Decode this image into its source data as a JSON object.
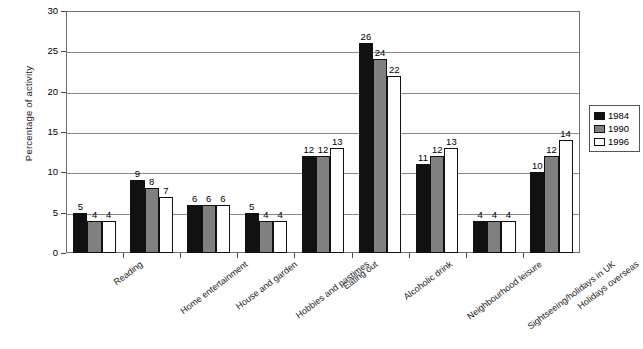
{
  "chart_data": {
    "type": "bar",
    "title": "",
    "xlabel": "",
    "ylabel": "Percentage of activity",
    "ylim": [
      0,
      30
    ],
    "ytick_step": 5,
    "yticks": [
      "0",
      "5",
      "10",
      "15",
      "20",
      "25",
      "30"
    ],
    "grid": true,
    "legend_position": "right",
    "categories": [
      "Reading",
      "Home entertainment",
      "House and garden",
      "Hobbies and pastimes",
      "Eating out",
      "Alcoholic drink",
      "Neighbourhood leisure",
      "Sightseeing/holidays in UK",
      "Holidays overseas"
    ],
    "series": [
      {
        "name": "1984",
        "color": "#111111",
        "values": [
          5,
          9,
          6,
          5,
          12,
          26,
          11,
          4,
          10
        ]
      },
      {
        "name": "1990",
        "color": "#808080",
        "values": [
          4,
          8,
          6,
          4,
          12,
          24,
          12,
          4,
          12
        ]
      },
      {
        "name": "1996",
        "color": "#ffffff",
        "values": [
          4,
          7,
          6,
          4,
          13,
          22,
          13,
          4,
          14
        ]
      }
    ]
  },
  "legend": {
    "entries": [
      {
        "label": "1984",
        "swatch": "black-swatch"
      },
      {
        "label": "1990",
        "swatch": "gray-swatch"
      },
      {
        "label": "1996",
        "swatch": "white-swatch"
      }
    ]
  }
}
